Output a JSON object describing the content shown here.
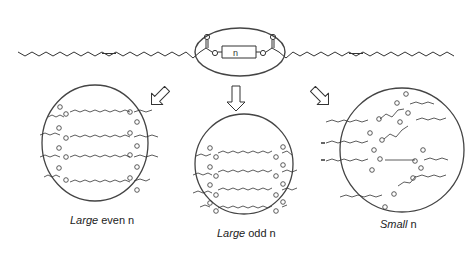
{
  "diagram": {
    "top_molecule": {
      "description": "diester of two oleic-type chains linked by spacer of length n",
      "spacer_label": "n",
      "oxygen_label": "O"
    },
    "arrows": [
      "left-down",
      "down",
      "right-down"
    ],
    "panels": [
      {
        "label_italic": "Large",
        "label_rest": " even n",
        "chains": 4
      },
      {
        "label_italic": "Large",
        "label_rest": " odd n",
        "chains": 4
      },
      {
        "label_italic": "Small",
        "label_rest": " n",
        "chains": 4
      }
    ],
    "colors": {
      "line": "#333333",
      "background": "#ffffff"
    }
  }
}
